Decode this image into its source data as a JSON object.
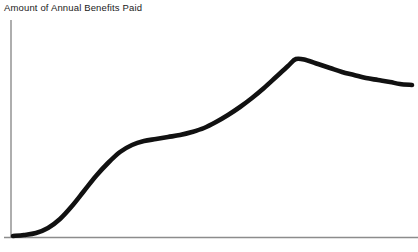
{
  "chart_data": {
    "type": "line",
    "title": "Amount of Annual Benefits Paid",
    "subtitle": "",
    "xlabel": "",
    "ylabel": "",
    "xticklabels": [],
    "yticklabels": [],
    "grid": false,
    "legend": null,
    "annotations": [],
    "axis_color": "#8c8c8c",
    "line_color": "#111111",
    "line_width": 4.6,
    "background": "#ffffff",
    "xlim": [
      0,
      418
    ],
    "ylim": [
      252,
      0
    ],
    "series": [
      {
        "name": "Annual benefits paid",
        "x": [
          13,
          24,
          36,
          48,
          60,
          72,
          84,
          96,
          108,
          120,
          132,
          144,
          156,
          168,
          180,
          192,
          204,
          216,
          228,
          240,
          252,
          264,
          276,
          288,
          296,
          306,
          318,
          330,
          342,
          354,
          366,
          378,
          390,
          400,
          412
        ],
        "y": [
          236,
          235,
          233,
          228,
          219,
          206,
          191,
          176,
          163,
          152,
          145,
          141,
          139,
          137,
          135,
          132,
          128,
          122,
          115,
          107,
          98,
          88,
          77,
          66,
          59,
          60,
          64,
          68,
          72,
          75,
          78,
          80,
          82,
          84,
          85
        ]
      }
    ]
  },
  "axes": {
    "y_axis": {
      "x": 11,
      "y_top": 20,
      "y_bottom": 237
    },
    "x_axis": {
      "y": 237,
      "x_left": 4,
      "x_right": 418
    }
  }
}
